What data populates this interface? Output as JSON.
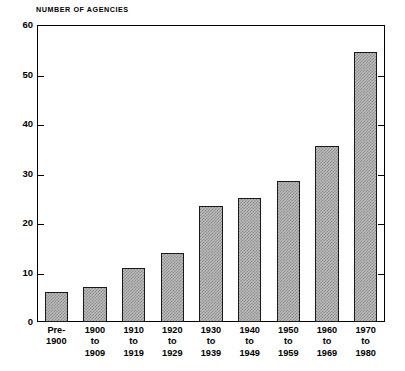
{
  "chart_data": {
    "type": "bar",
    "title": "NUMBER OF AGENCIES",
    "xlabel": "",
    "ylabel": "NUMBER OF AGENCIES",
    "ylim": [
      0,
      60
    ],
    "yticks": [
      0,
      10,
      20,
      30,
      40,
      50,
      60
    ],
    "ytick_labels": [
      "0",
      "10",
      "20",
      "30",
      "40",
      "50",
      "60"
    ],
    "grid": false,
    "legend": null,
    "bar_fill": "#b9b9b9",
    "bar_hatch": "checkerboard-dither",
    "bar_edge_color": "#1a1a1a",
    "categories": [
      "Pre-1900",
      "1900 to 1909",
      "1910 to 1919",
      "1920 to 1929",
      "1930 to 1939",
      "1940 to 1949",
      "1950 to 1959",
      "1960 to 1969",
      "1970 to 1980"
    ],
    "category_lines": [
      [
        "Pre-",
        "1900"
      ],
      [
        "1900",
        "to",
        "1909"
      ],
      [
        "1910",
        "to",
        "1919"
      ],
      [
        "1920",
        "to",
        "1929"
      ],
      [
        "1930",
        "to",
        "1939"
      ],
      [
        "1940",
        "to",
        "1949"
      ],
      [
        "1950",
        "to",
        "1959"
      ],
      [
        "1960",
        "to",
        "1969"
      ],
      [
        "1970",
        "to",
        "1980"
      ]
    ],
    "values": [
      6,
      7,
      11,
      14,
      23.5,
      25,
      28.5,
      35.5,
      54.5
    ]
  }
}
